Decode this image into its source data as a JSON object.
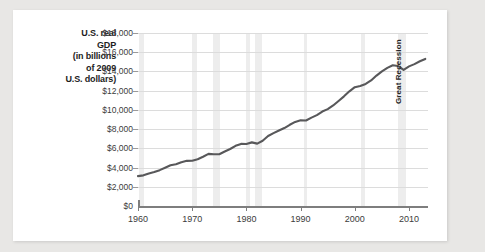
{
  "figure": {
    "background_color": "#e8e7e5",
    "card_color": "#ffffff",
    "y_axis_title_lines": [
      "U.S. real",
      "GDP",
      "(in billions",
      "of 2009",
      "U.S. dollars)"
    ]
  },
  "chart_data": {
    "type": "line",
    "title": "",
    "xlabel": "",
    "ylabel": "U.S. real GDP (in billions of 2009 U.S. dollars)",
    "xlim": [
      1960,
      2013.5
    ],
    "ylim": [
      0,
      18000
    ],
    "grid": true,
    "legend": false,
    "line_color": "#58585a",
    "line_width": 2.1,
    "ytick_labels": [
      "$0",
      "$2,000",
      "$4,000",
      "$6,000",
      "$8,000",
      "$10,000",
      "$12,000",
      "$14,000",
      "$16,000",
      "$18,000"
    ],
    "ytick_values": [
      0,
      2000,
      4000,
      6000,
      8000,
      10000,
      12000,
      14000,
      16000,
      18000
    ],
    "xtick_labels": [
      "1960",
      "1970",
      "1980",
      "1990",
      "2000",
      "2010"
    ],
    "xtick_values": [
      1960,
      1970,
      1980,
      1990,
      2000,
      2010
    ],
    "annotations": [
      {
        "text": "Great Recession",
        "x": 2008.2,
        "rotation": 90,
        "color": "#262626"
      }
    ],
    "shaded_bands": {
      "label": "recession-band",
      "color": "#ededed",
      "ranges": [
        [
          1960.2,
          1961.1
        ],
        [
          1969.9,
          1970.9
        ],
        [
          1973.9,
          1975.2
        ],
        [
          1980.0,
          1980.6
        ],
        [
          1981.5,
          1982.9
        ],
        [
          1990.6,
          1991.2
        ],
        [
          2001.2,
          2001.9
        ],
        [
          2007.9,
          2009.5
        ]
      ]
    },
    "x": [
      1960,
      1961,
      1962,
      1963,
      1964,
      1965,
      1966,
      1967,
      1968,
      1969,
      1970,
      1971,
      1972,
      1973,
      1974,
      1975,
      1976,
      1977,
      1978,
      1979,
      1980,
      1981,
      1982,
      1983,
      1984,
      1985,
      1986,
      1987,
      1988,
      1989,
      1990,
      1991,
      1992,
      1993,
      1994,
      1995,
      1996,
      1997,
      1998,
      1999,
      2000,
      2001,
      2002,
      2003,
      2004,
      2005,
      2006,
      2007,
      2008,
      2009,
      2010,
      2011,
      2012,
      2013
    ],
    "values": [
      3110,
      3190,
      3380,
      3530,
      3730,
      3980,
      4240,
      4350,
      4560,
      4700,
      4710,
      4870,
      5130,
      5420,
      5390,
      5380,
      5670,
      5930,
      6260,
      6460,
      6450,
      6620,
      6490,
      6790,
      7280,
      7580,
      7850,
      8110,
      8450,
      8750,
      8920,
      8900,
      9190,
      9450,
      9830,
      10080,
      10460,
      10930,
      11410,
      11930,
      12360,
      12480,
      12700,
      13060,
      13570,
      14010,
      14370,
      14640,
      14560,
      14170,
      14530,
      14760,
      15060,
      15300
    ]
  }
}
